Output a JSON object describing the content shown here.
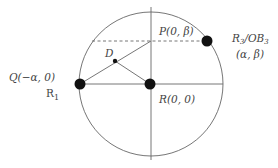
{
  "diagram": {
    "labels": {
      "P": "P(0, β)",
      "R": "R(0, 0)",
      "Q": "Q(−α, 0)",
      "R1": "R",
      "R1_sub": "1",
      "D": "D",
      "R3_main": "R",
      "R3_sub": "3",
      "R3_slash": "/OB",
      "R3_sub2": "3",
      "R3_coords": "(α, β)"
    },
    "colors": {
      "stroke": "#555555",
      "dot": "#111111"
    }
  }
}
